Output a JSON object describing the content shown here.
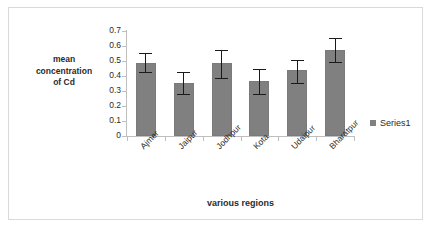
{
  "chart_data": {
    "type": "bar",
    "title": "",
    "xlabel": "various regions",
    "ylabel": "mean concentration of Cd",
    "ylabel_lines": [
      "mean",
      "concentration",
      "of Cd"
    ],
    "categories": [
      "Ajmer",
      "Jaipur",
      "Jodhpur",
      "Kota",
      "Udaipur",
      "Bharatpur"
    ],
    "series": [
      {
        "name": "Series1",
        "values": [
          0.49,
          0.355,
          0.485,
          0.365,
          0.44,
          0.575
        ],
        "errors_low": [
          0.43,
          0.28,
          0.39,
          0.28,
          0.355,
          0.495
        ],
        "errors_high": [
          0.555,
          0.43,
          0.575,
          0.45,
          0.51,
          0.655
        ]
      }
    ],
    "ylim": [
      0,
      0.7
    ],
    "ytick_labels": [
      "0.7",
      "0.6",
      "0.5",
      "0.4",
      "0.3",
      "0.2",
      "0.1",
      "0"
    ],
    "ytick_values": [
      0.7,
      0.6,
      0.5,
      0.4,
      0.3,
      0.2,
      0.1,
      0
    ],
    "grid": false,
    "legend_position": "right",
    "bar_color": "#808080",
    "error_color": "#1a1a1a",
    "axis_color": "#bfbfbf",
    "text_color": "#2b2b2b"
  },
  "legend": {
    "entries": [
      {
        "label": "Series1",
        "color": "#808080"
      }
    ]
  }
}
